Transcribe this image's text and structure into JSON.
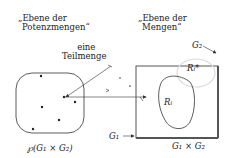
{
  "left_plane": {
    "title_line1": "„Ebene der",
    "title_line2": "Potenzmengen“",
    "set_label": "℘(G₁ × G₂)",
    "annotation_line1": "eine",
    "annotation_line2": "Teilmenge"
  },
  "right_plane": {
    "title_line1": "„Ebene der",
    "title_line2": "Mengen“",
    "g1_label": "G₁",
    "g2_label": "G₂",
    "product_label": "G₁ × G₂",
    "region_label": "Rᵢ",
    "region_star_label": "Rᵢ*"
  },
  "colors": {
    "stroke": "#333333",
    "frame_dark": "#555555",
    "faint": "#d8d8d8"
  }
}
